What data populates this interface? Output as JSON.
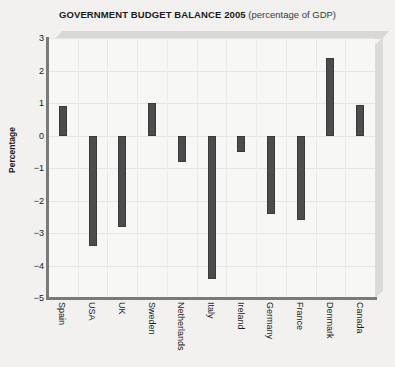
{
  "chart_data": {
    "type": "bar",
    "title": "GOVERNMENT BUDGET BALANCE 2005 (percentage of GDP)",
    "title_main": "GOVERNMENT BUDGET BALANCE 2005",
    "title_sub": " (percentage of GDP)",
    "xlabel": "",
    "ylabel": "Percentage",
    "ylim": [
      -5,
      3
    ],
    "yticks": [
      3,
      2,
      1,
      0,
      -1,
      -2,
      -3,
      -4,
      -5
    ],
    "ytick_labels": [
      "3",
      "2",
      "1",
      "0",
      "−1",
      "−2",
      "−3",
      "−4",
      "−5"
    ],
    "grid": true,
    "legend": false,
    "bar_color": "#4c4c4c",
    "plot_background": "#f7f7f5",
    "page_background": "#f2f1ef",
    "categories": [
      "Spain",
      "USA",
      "UK",
      "Sweden",
      "Netherlands",
      "Italy",
      "Ireland",
      "Germany",
      "France",
      "Denmark",
      "Canada"
    ],
    "values": [
      0.9,
      -3.4,
      -2.8,
      1.0,
      -0.8,
      -4.4,
      -0.5,
      -2.4,
      -2.6,
      2.4,
      0.95
    ]
  }
}
